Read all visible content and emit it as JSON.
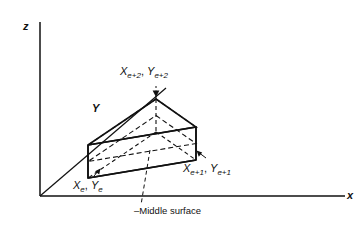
{
  "figure": {
    "type": "3d-wedge-element-diagram",
    "background_color": "#ffffff",
    "line_color": "#111111",
    "axes": {
      "z_label": "z",
      "x_label": "x",
      "y_label": "Y"
    },
    "nodes": [
      {
        "id": "node-e",
        "x_symbol": "X",
        "x_sub": "e",
        "y_symbol": "Y",
        "y_sub": "e",
        "separator": ", "
      },
      {
        "id": "node-e1",
        "x_symbol": "X",
        "x_sub": "e+1",
        "y_symbol": "Y",
        "y_sub": "e+1",
        "separator": ", "
      },
      {
        "id": "node-e2",
        "x_symbol": "X",
        "x_sub": "e+2",
        "y_symbol": "Y",
        "y_sub": "e+2",
        "separator": ", "
      }
    ],
    "annotation": {
      "leader_text": "Middle surface",
      "dash_prefix": "–"
    }
  }
}
